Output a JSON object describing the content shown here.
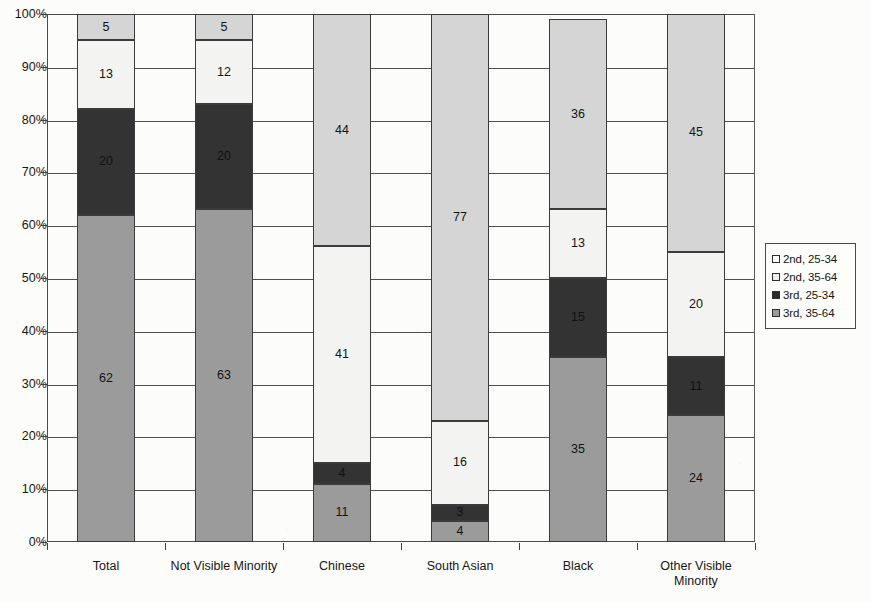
{
  "chart_data": {
    "type": "bar",
    "variant": "stacked-100-percent",
    "title": "",
    "xlabel": "",
    "ylabel": "",
    "ylim": [
      0,
      100
    ],
    "ytick_labels": [
      "0%",
      "10%",
      "20%",
      "30%",
      "40%",
      "50%",
      "60%",
      "70%",
      "80%",
      "90%",
      "100%"
    ],
    "ytick_values": [
      0,
      10,
      20,
      30,
      40,
      50,
      60,
      70,
      80,
      90,
      100
    ],
    "grid": true,
    "legend_position": "right",
    "categories": [
      "Total",
      "Not Visible Minority",
      "Chinese",
      "South Asian",
      "Black",
      "Other Visible Minority"
    ],
    "series": [
      {
        "name": "3rd, 35-64",
        "color": "#9b9b9b",
        "values": [
          62,
          63,
          11,
          4,
          35,
          24
        ]
      },
      {
        "name": "3rd, 25-34",
        "color": "#333333",
        "values": [
          20,
          20,
          4,
          3,
          15,
          11
        ]
      },
      {
        "name": "2nd, 35-64",
        "color": "#f3f3f1",
        "values": [
          13,
          12,
          41,
          16,
          13,
          20
        ]
      },
      {
        "name": "2nd, 25-34",
        "color": "#d5d5d5",
        "values": [
          5,
          5,
          44,
          77,
          36,
          45
        ]
      }
    ]
  },
  "legend": {
    "items": [
      {
        "label": "2nd, 25-34",
        "swatch": "s-2nd-2534"
      },
      {
        "label": "2nd, 35-64",
        "swatch": "s-2nd-3564"
      },
      {
        "label": "3rd, 25-34",
        "swatch": "s-3rd-2534"
      },
      {
        "label": "3rd, 35-64",
        "swatch": "s-3rd-3564"
      }
    ]
  }
}
